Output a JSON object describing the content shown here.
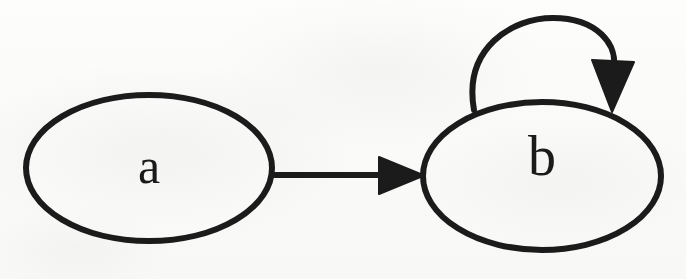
{
  "figure": {
    "kind": "state-transition-diagram",
    "title": "",
    "background_color": "#fdfdfc",
    "stroke_color": "#1b1b1b",
    "fill_color": "#ffffff"
  },
  "nodes": [
    {
      "id": "a",
      "label": "a",
      "shape": "ellipse",
      "cx": 149,
      "cy": 168,
      "rx": 123,
      "ry": 73
    },
    {
      "id": "b",
      "label": "b",
      "shape": "ellipse",
      "cx": 542,
      "cy": 176,
      "rx": 119,
      "ry": 74
    }
  ],
  "edges": [
    {
      "id": "a-to-b",
      "from": "a",
      "to": "b",
      "label": "",
      "kind": "straight",
      "arrowhead": "filled-triangle",
      "direction": "right"
    },
    {
      "id": "b-to-b",
      "from": "b",
      "to": "b",
      "label": "",
      "kind": "self-loop",
      "arrowhead": "filled-triangle",
      "direction": "down"
    }
  ],
  "accessibility": {
    "description": "Directed graph with two states labeled a and b. An arrow points from a to b, and b has a self-loop arrow."
  }
}
